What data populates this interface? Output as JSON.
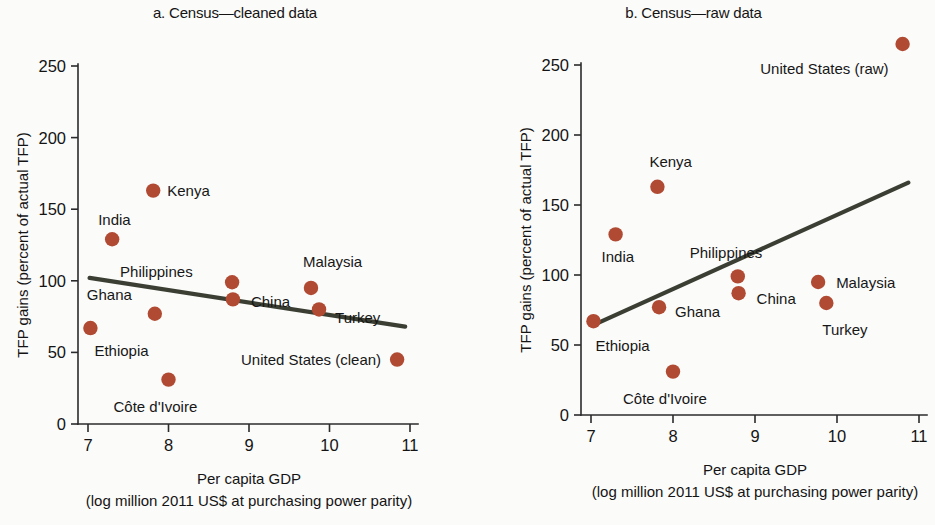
{
  "figure": {
    "background_color": "#fbfbfa",
    "marker_color": "#b04a32",
    "trend_line_color": "#3b3f33",
    "axis_color": "#2b2b2b"
  },
  "chart_data": [
    {
      "type": "scatter",
      "panel_id": "a",
      "title": "a. Census—cleaned data",
      "xlabel": "Per capita GDP",
      "xlabel_sub": "(log million 2011 US$ at purchasing power parity)",
      "ylabel": "TFP gains (percent of actual TFP)",
      "xlim": [
        6.7,
        11.2
      ],
      "ylim": [
        0,
        262
      ],
      "xticks": [
        7,
        8,
        9,
        10,
        11
      ],
      "xtick_labels": [
        "7",
        "8",
        "9",
        "10",
        "11"
      ],
      "yticks": [
        0,
        50,
        100,
        150,
        200,
        250
      ],
      "ytick_labels": [
        "0",
        "50",
        "100",
        "150",
        "200",
        "250"
      ],
      "grid": false,
      "legend": "none",
      "points": [
        {
          "label": "Ethiopia",
          "x": 7.03,
          "y": 67,
          "label_dx": 4,
          "label_dy": 28,
          "anchor": "start"
        },
        {
          "label": "India",
          "x": 7.3,
          "y": 129,
          "label_dx": -14,
          "label_dy": -14,
          "anchor": "start"
        },
        {
          "label": "Kenya",
          "x": 7.81,
          "y": 163,
          "label_dx": 14,
          "label_dy": 5,
          "anchor": "start"
        },
        {
          "label": "Ghana",
          "x": 7.83,
          "y": 77,
          "label_dx": -68,
          "label_dy": -14,
          "anchor": "start"
        },
        {
          "label": "Côte d'Ivoire",
          "x": 8.0,
          "y": 31,
          "label_dx": -55,
          "label_dy": 32,
          "anchor": "start"
        },
        {
          "label": "Philippines",
          "x": 8.79,
          "y": 99,
          "label_dx": -112,
          "label_dy": -5,
          "anchor": "start"
        },
        {
          "label": "China",
          "x": 8.8,
          "y": 87,
          "label_dx": 18,
          "label_dy": 8,
          "anchor": "start"
        },
        {
          "label": "Malaysia",
          "x": 9.77,
          "y": 95,
          "label_dx": -8,
          "label_dy": -21,
          "anchor": "start"
        },
        {
          "label": "Turkey",
          "x": 9.87,
          "y": 80,
          "label_dx": 16,
          "label_dy": 14,
          "anchor": "start"
        },
        {
          "label": "United States (clean)",
          "x": 10.84,
          "y": 45,
          "label_dx": -16,
          "label_dy": 5,
          "anchor": "end"
        }
      ],
      "trend": {
        "x0": 7.02,
        "y0": 102,
        "x1": 10.94,
        "y1": 68,
        "slope_sign": "negative"
      }
    },
    {
      "type": "scatter",
      "panel_id": "b",
      "title": "b. Census—raw data",
      "xlabel": "Per capita GDP",
      "xlabel_sub": "(log million 2011 US$ at purchasing power parity)",
      "ylabel": "TFP gains (percent of actual TFP)",
      "xlim": [
        6.7,
        11.2
      ],
      "ylim": [
        0,
        285
      ],
      "xticks": [
        7,
        8,
        9,
        10,
        11
      ],
      "xtick_labels": [
        "7",
        "8",
        "9",
        "10",
        "11"
      ],
      "yticks": [
        0,
        50,
        100,
        150,
        200,
        250
      ],
      "ytick_labels": [
        "0",
        "50",
        "100",
        "150",
        "200",
        "250"
      ],
      "grid": false,
      "legend": "none",
      "points": [
        {
          "label": "Ethiopia",
          "x": 7.03,
          "y": 67,
          "label_dx": 2,
          "label_dy": 30,
          "anchor": "start"
        },
        {
          "label": "India",
          "x": 7.3,
          "y": 129,
          "label_dx": -14,
          "label_dy": 28,
          "anchor": "start"
        },
        {
          "label": "Kenya",
          "x": 7.81,
          "y": 163,
          "label_dx": -8,
          "label_dy": -20,
          "anchor": "start"
        },
        {
          "label": "Ghana",
          "x": 7.83,
          "y": 77,
          "label_dx": 16,
          "label_dy": 10,
          "anchor": "start"
        },
        {
          "label": "Côte d'Ivoire",
          "x": 8.0,
          "y": 31,
          "label_dx": -50,
          "label_dy": 32,
          "anchor": "start"
        },
        {
          "label": "Philippines",
          "x": 8.79,
          "y": 99,
          "label_dx": -48,
          "label_dy": -18,
          "anchor": "start"
        },
        {
          "label": "China",
          "x": 8.8,
          "y": 87,
          "label_dx": 18,
          "label_dy": 11,
          "anchor": "start"
        },
        {
          "label": "Malaysia",
          "x": 9.77,
          "y": 95,
          "label_dx": 18,
          "label_dy": 6,
          "anchor": "start"
        },
        {
          "label": "Turkey",
          "x": 9.87,
          "y": 80,
          "label_dx": -4,
          "label_dy": 32,
          "anchor": "start"
        },
        {
          "label": "United States (raw)",
          "x": 10.8,
          "y": 265,
          "label_dx": -14,
          "label_dy": 30,
          "anchor": "end"
        }
      ],
      "trend": {
        "x0": 7.02,
        "y0": 64,
        "x1": 10.87,
        "y1": 166,
        "slope_sign": "positive"
      }
    }
  ]
}
